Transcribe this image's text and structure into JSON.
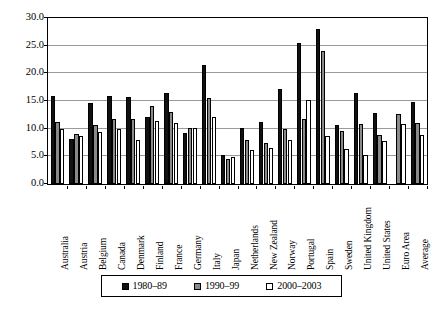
{
  "chart_data": {
    "type": "bar",
    "title": "",
    "xlabel": "",
    "ylabel": "",
    "ylim": [
      0.0,
      30.0
    ],
    "ytick_labels": [
      "30.0",
      "25.0",
      "20.0",
      "15.0",
      "10.0",
      "5.0",
      "0.0"
    ],
    "ytick_values": [
      30.0,
      25.0,
      20.0,
      15.0,
      10.0,
      5.0,
      0.0
    ],
    "grid": true,
    "legend_position": "bottom",
    "categories": [
      "Australia",
      "Austria",
      "Belgium",
      "Canada",
      "Denmark",
      "Finland",
      "France",
      "Germany",
      "Italy",
      "Japan",
      "Netherlands",
      "New Zealand",
      "Norway",
      "Portugal",
      "Spain",
      "Sweden",
      "United Kingdom",
      "United States",
      "Euro Area",
      "Average"
    ],
    "series": [
      {
        "name": "1980–89",
        "color": "#111111",
        "values": [
          15.9,
          8.1,
          14.7,
          15.9,
          15.8,
          12.1,
          16.5,
          9.3,
          21.5,
          5.2,
          10.2,
          11.2,
          17.1,
          25.4,
          28.1,
          10.6,
          16.5,
          12.9,
          null,
          14.9
        ]
      },
      {
        "name": "1990–99",
        "color": "#8a8a8a",
        "values": [
          11.2,
          9.0,
          10.7,
          11.7,
          11.7,
          14.1,
          13.0,
          10.1,
          15.5,
          4.5,
          8.0,
          7.4,
          10.0,
          11.8,
          24.1,
          9.5,
          10.8,
          8.9,
          12.6,
          11.0
        ]
      },
      {
        "name": "2000–2003",
        "color": "#ffffff",
        "values": [
          10.0,
          8.7,
          9.4,
          10.0,
          7.9,
          11.3,
          11.0,
          10.1,
          12.1,
          4.8,
          6.1,
          6.5,
          7.9,
          15.2,
          8.6,
          6.3,
          5.2,
          7.8,
          10.8,
          8.8
        ]
      }
    ]
  },
  "legend": {
    "items": [
      {
        "label": "1980–89"
      },
      {
        "label": "1990–99"
      },
      {
        "label": "2000–2003"
      }
    ]
  }
}
